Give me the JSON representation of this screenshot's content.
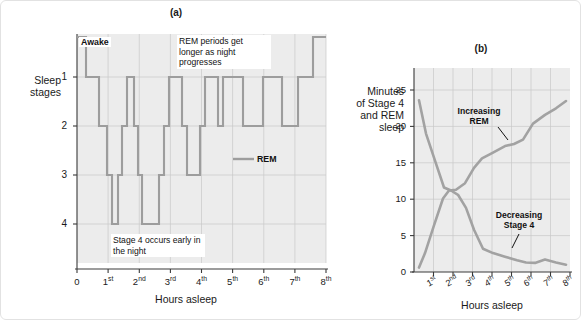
{
  "figure": {
    "panel_a_title": "(a)",
    "panel_b_title": "(b)"
  },
  "panel_a": {
    "ylabel_line1": "Sleep",
    "ylabel_line2": "stages",
    "xlabel": "Hours asleep",
    "y_ticks": [
      "1",
      "2",
      "3",
      "4"
    ],
    "x_ticks": [
      {
        "num": "0",
        "sup": ""
      },
      {
        "num": "1",
        "sup": "st"
      },
      {
        "num": "2",
        "sup": "nd"
      },
      {
        "num": "3",
        "sup": "rd"
      },
      {
        "num": "4",
        "sup": "th"
      },
      {
        "num": "5",
        "sup": "th"
      },
      {
        "num": "6",
        "sup": "th"
      },
      {
        "num": "7",
        "sup": "th"
      },
      {
        "num": "8",
        "sup": "th"
      }
    ],
    "awake_label": "Awake",
    "legend_label": "REM",
    "annotation_rem": "REM periods get longer as night progresses",
    "annotation_stage4": "Stage 4 occurs early in the night"
  },
  "panel_b": {
    "ylabel_line1": "Minutes",
    "ylabel_line2": "of Stage 4",
    "ylabel_line3": "and REM",
    "ylabel_line4": "sleep",
    "xlabel": "Hours asleep",
    "annotation_rem": "Increasing REM",
    "annotation_stage4": "Decreasing Stage 4",
    "x_ticks": [
      {
        "num": "1",
        "sup": "st"
      },
      {
        "num": "2",
        "sup": "nd"
      },
      {
        "num": "3",
        "sup": "rd"
      },
      {
        "num": "4",
        "sup": "th"
      },
      {
        "num": "5",
        "sup": "th"
      },
      {
        "num": "6",
        "sup": "th"
      },
      {
        "num": "7",
        "sup": "th"
      },
      {
        "num": "8",
        "sup": "th"
      }
    ]
  },
  "colors": {
    "trace": "#9d9d9d",
    "plot_background": "#ececec",
    "gridline": "#c9c9c9",
    "axis": "#3a3a3a"
  },
  "chart_data": [
    {
      "type": "line",
      "id": "hypnogram",
      "title": "(a)",
      "xlabel": "Hours asleep",
      "ylabel": "Sleep stages",
      "xlim": [
        0,
        8
      ],
      "ylim": [
        0,
        4
      ],
      "y_ticks": [
        1,
        2,
        3,
        4
      ],
      "y_tick_labels": [
        "1",
        "2",
        "3",
        "4"
      ],
      "y_extra_level": "Awake",
      "x_ticks": [
        0,
        1,
        2,
        3,
        4,
        5,
        6,
        7,
        8
      ],
      "x_tick_labels": [
        "0",
        "1st",
        "2nd",
        "3rd",
        "4th",
        "5th",
        "6th",
        "7th",
        "8th"
      ],
      "grid": true,
      "note": "Step plot of sleep stage vs hours asleep; y axis inverted (Awake at top, stage 4 at bottom). Stage value 0 = Awake.",
      "series": [
        {
          "name": "Sleep stage",
          "step": "post",
          "x": [
            0.0,
            0.3,
            0.45,
            0.72,
            0.88,
            1.02,
            1.12,
            1.3,
            1.42,
            1.6,
            1.72,
            1.82,
            1.95,
            2.2,
            2.38,
            2.62,
            2.8,
            2.95,
            3.2,
            3.4,
            3.52,
            3.72,
            3.88,
            4.08,
            4.22,
            4.55,
            4.75,
            5.35,
            5.55,
            5.95,
            6.18,
            6.62,
            6.9,
            7.38,
            7.55,
            8.0
          ],
          "y": [
            0.0,
            0.0,
            1.0,
            2.0,
            3.0,
            4.0,
            4.0,
            3.0,
            2.0,
            1.0,
            1.0,
            2.0,
            3.0,
            4.0,
            4.0,
            3.0,
            2.0,
            1.0,
            1.0,
            2.0,
            3.0,
            3.0,
            2.0,
            1.0,
            1.0,
            2.0,
            1.0,
            1.0,
            2.0,
            2.0,
            1.0,
            1.0,
            2.0,
            1.0,
            0.0,
            0.0
          ]
        }
      ],
      "legend": [
        {
          "label": "REM",
          "color": "#9d9d9d"
        }
      ],
      "legend_position": "inside-right-middle",
      "annotations": [
        {
          "text": "Awake",
          "x": 0.1,
          "y": 0.0
        },
        {
          "text": "REM periods get longer as night progresses",
          "x": 3.0,
          "y": 0.2
        },
        {
          "text": "Stage 4 occurs early in the night",
          "x": 1.1,
          "y": 4.4
        }
      ]
    },
    {
      "type": "line",
      "id": "stage4-rem-minutes",
      "title": "(b)",
      "xlabel": "Hours asleep",
      "ylabel": "Minutes of Stage 4 and REM sleep",
      "xlim": [
        0.5,
        8.5
      ],
      "ylim": [
        0,
        28
      ],
      "y_ticks": [
        0,
        5,
        10,
        15,
        20,
        25
      ],
      "y_tick_labels": [
        "0",
        "5",
        "10",
        "15",
        "20",
        "25"
      ],
      "x_ticks": [
        1,
        2,
        3,
        4,
        5,
        6,
        7,
        8
      ],
      "x_tick_labels": [
        "1st",
        "2nd",
        "3rd",
        "4th",
        "5th",
        "6th",
        "7th",
        "8th"
      ],
      "grid": true,
      "series": [
        {
          "name": "Increasing REM",
          "color": "#a2a2a2",
          "x": [
            0.7,
            1.0,
            1.45,
            1.9,
            2.2,
            2.55,
            3.0,
            3.45,
            3.85,
            4.4,
            5.0,
            5.45,
            5.9,
            6.4,
            7.0,
            7.55,
            8.15
          ],
          "y": [
            0.6,
            2.6,
            6.4,
            10.1,
            11.2,
            11.3,
            12.2,
            14.3,
            15.6,
            16.4,
            17.3,
            17.6,
            18.2,
            20.4,
            21.6,
            22.5,
            23.5
          ]
        },
        {
          "name": "Decreasing Stage 4",
          "color": "#a2a2a2",
          "x": [
            0.7,
            1.05,
            1.5,
            1.95,
            2.3,
            2.65,
            3.05,
            3.45,
            3.9,
            4.4,
            5.0,
            5.6,
            6.1,
            6.55,
            7.05,
            7.55,
            8.15
          ],
          "y": [
            23.6,
            19.0,
            15.3,
            11.6,
            11.2,
            10.6,
            8.8,
            5.8,
            3.2,
            2.6,
            2.1,
            1.6,
            1.3,
            1.25,
            1.7,
            1.3,
            1.0
          ]
        }
      ],
      "annotations": [
        {
          "text": "Increasing REM",
          "x": 4.0,
          "y": 20.0
        },
        {
          "text": "Decreasing Stage 4",
          "x": 5.6,
          "y": 5.6
        }
      ]
    }
  ]
}
